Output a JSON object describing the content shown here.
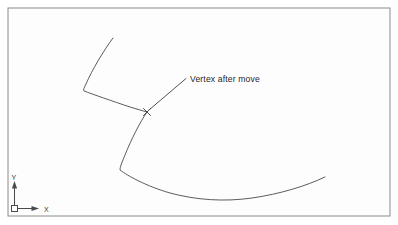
{
  "figure": {
    "name": "autocad-polyline-vertex-move-illustration",
    "background_color": "#fdfdfd",
    "frame": {
      "name": "drawing-frame-border",
      "stroke_color": "#8a8a8a",
      "x": 8,
      "y": 8,
      "width": 382,
      "height": 208
    },
    "annotation": {
      "label": "Vertex after move",
      "text_x": 190,
      "text_y": 82,
      "leader_from_x": 186,
      "leader_from_y": 79,
      "leader_to_x": 149,
      "leader_to_y": 110,
      "stroke_color": "#3f3f3f"
    },
    "vertex_marker": {
      "label": "X",
      "center_x": 147,
      "center_y": 112,
      "size": 5,
      "stroke_color": "#3a3a3a"
    },
    "curves": [
      {
        "name": "upper-polyline-segment",
        "stroke_color": "#4a4a4a",
        "path": "M 113 38 C 104 50 92 70 86 84 C 84 88 83 90 84 91 C 92 94 112 101 130 107 C 137 109 143 111 147 112",
        "start_point": [
          113,
          38
        ],
        "end_point": [
          147,
          112
        ]
      },
      {
        "name": "lower-polyline-segment",
        "stroke_color": "#4a4a4a",
        "path": "M 147 112 C 140 122 131 140 125 155 C 122 162 120 167 120 170 C 128 176 146 186 170 193 C 196 200 224 202 252 198 C 280 194 306 186 325 177",
        "start_point": [
          147,
          112
        ],
        "end_point": [
          325,
          177
        ]
      }
    ],
    "ucs_icon": {
      "name": "ucs-coordinate-icon",
      "origin_x": 14,
      "origin_y": 209,
      "y_label": "Y",
      "x_label": "X",
      "y_label_x": 11,
      "y_label_y": 180,
      "x_label_x": 44,
      "x_label_y": 212,
      "axis_length_y": 26,
      "axis_length_x": 24,
      "stroke_color": "#4a4a4a"
    }
  }
}
